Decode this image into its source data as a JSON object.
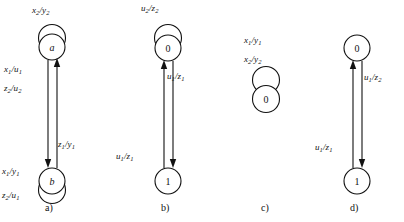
{
  "figure": {
    "type": "state-transition-diagrams",
    "background_color": "#ffffff",
    "stroke_color": "#111111",
    "diagrams": [
      {
        "caption": "a)",
        "states": [
          {
            "name": "state-a",
            "label": "a",
            "italic": true,
            "position": "top",
            "self_loop": true
          },
          {
            "name": "state-b",
            "label": "b",
            "italic": true,
            "position": "bottom",
            "self_loop": true
          }
        ],
        "labels": [
          {
            "name": "self-loop-label-top",
            "text": "x2/y2",
            "x": 32,
            "y": 6
          },
          {
            "name": "transition-label-down-1",
            "text": "x1/u1",
            "x": 4,
            "y": 65
          },
          {
            "name": "transition-label-down-2",
            "text": "z2/u2",
            "x": 4,
            "y": 84
          },
          {
            "name": "transition-label-up",
            "text": "z1/y1",
            "x": 58,
            "y": 140
          },
          {
            "name": "self-loop-label-bottom-1",
            "text": "x1/y1",
            "x": 2,
            "y": 167
          },
          {
            "name": "self-loop-label-bottom-2",
            "text": "z2/u1",
            "x": 2,
            "y": 191
          }
        ]
      },
      {
        "caption": "b)",
        "states": [
          {
            "name": "state-0",
            "label": "0",
            "italic": false,
            "position": "top",
            "self_loop": true
          },
          {
            "name": "state-1",
            "label": "1",
            "italic": false,
            "position": "bottom",
            "self_loop": false
          }
        ],
        "labels": [
          {
            "name": "self-loop-label-top",
            "text": "u2/z2",
            "x": 31,
            "y": 4
          },
          {
            "name": "transition-label-down",
            "text": "u1/z1",
            "x": 57,
            "y": 72
          },
          {
            "name": "transition-label-up",
            "text": "u1/z1",
            "x": 6,
            "y": 152
          }
        ]
      },
      {
        "caption": "c)",
        "states": [
          {
            "name": "state-0",
            "label": "0",
            "italic": false,
            "position": "middle",
            "self_loop": true
          }
        ],
        "labels": [
          {
            "name": "self-loop-label-1",
            "text": "x1/y1",
            "x": 14,
            "y": 36
          },
          {
            "name": "self-loop-label-2",
            "text": "x2/y2",
            "x": 14,
            "y": 55
          }
        ]
      },
      {
        "caption": "d)",
        "states": [
          {
            "name": "state-0",
            "label": "0",
            "italic": false,
            "position": "top",
            "self_loop": false
          },
          {
            "name": "state-1",
            "label": "1",
            "italic": false,
            "position": "bottom",
            "self_loop": false
          }
        ],
        "labels": [
          {
            "name": "transition-label-down",
            "text": "u1/z2",
            "x": 54,
            "y": 73
          },
          {
            "name": "transition-label-up",
            "text": "u1/z1",
            "x": 5,
            "y": 143
          }
        ]
      }
    ]
  }
}
